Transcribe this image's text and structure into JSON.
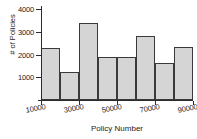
{
  "chart_data": {
    "type": "bar",
    "title": "",
    "subtitle": "",
    "xlabel": "Policy Number",
    "ylabel": "# of Policies",
    "bin_edges": [
      10000,
      20000,
      30000,
      40000,
      50000,
      60000,
      70000,
      80000,
      90000
    ],
    "categories": [
      "10000-20000",
      "20000-30000",
      "30000-40000",
      "40000-50000",
      "50000-60000",
      "60000-70000",
      "70000-80000",
      "80000-90000"
    ],
    "values": [
      2280,
      1230,
      3370,
      1870,
      1890,
      2820,
      1640,
      2350
    ],
    "xlim": [
      10000,
      90000
    ],
    "ylim": [
      0,
      4000
    ],
    "yticks": [
      1000,
      2000,
      3000,
      4000
    ],
    "ytick_labels": [
      "1000",
      "2000",
      "3000",
      "4000"
    ],
    "xticks": [
      10000,
      30000,
      50000,
      70000,
      90000
    ],
    "xtick_labels": [
      "10000",
      "30000",
      "50000",
      "70000",
      "90000"
    ],
    "grid": false,
    "legend": null,
    "bar_fill_color": "#d5d5d5",
    "bar_edge_color": "#3a3a3a",
    "axis_color": "#2b2b2b",
    "background_color": "#ffffff"
  }
}
